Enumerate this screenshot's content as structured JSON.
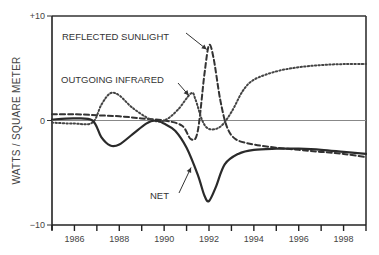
{
  "chart_data": {
    "type": "line",
    "title": "",
    "xlabel": "",
    "ylabel": "WATTS / SQUARE METER",
    "xlim": [
      1985,
      1999
    ],
    "ylim": [
      -10,
      10
    ],
    "x_ticks": [
      1986,
      1988,
      1990,
      1992,
      1994,
      1996,
      1998
    ],
    "x_minor_ticks": [
      1985,
      1987,
      1989,
      1991,
      1993,
      1995,
      1997,
      1999
    ],
    "y_ticks": [
      {
        "value": 10,
        "label": "+10"
      },
      {
        "value": 0,
        "label": "0"
      },
      {
        "value": -10,
        "label": "−10"
      }
    ],
    "zero_line": true,
    "series": [
      {
        "name": "REFLECTED SUNLIGHT",
        "style": "dashed",
        "x": [
          1985,
          1986,
          1987,
          1988,
          1989,
          1990,
          1990.8,
          1991.2,
          1991.5,
          1991.8,
          1992.0,
          1992.2,
          1992.5,
          1992.8,
          1993.2,
          1994,
          1995,
          1996,
          1997,
          1998,
          1999
        ],
        "y": [
          0.6,
          0.6,
          0.5,
          0.4,
          0.2,
          0.0,
          -0.5,
          -1.8,
          -1.0,
          4.5,
          7.2,
          6.0,
          2.0,
          -0.6,
          -1.8,
          -2.3,
          -2.6,
          -2.8,
          -3.0,
          -3.2,
          -3.5
        ]
      },
      {
        "name": "OUTGOING INFRARED",
        "style": "dotted",
        "x": [
          1985,
          1986,
          1986.8,
          1987.2,
          1987.6,
          1988,
          1988.6,
          1989.4,
          1990,
          1990.6,
          1991.2,
          1991.4,
          1991.7,
          1992,
          1992.5,
          1993,
          1993.5,
          1994,
          1995,
          1996,
          1997,
          1998,
          1999
        ],
        "y": [
          -0.2,
          -0.3,
          -0.2,
          1.5,
          2.6,
          2.4,
          1.2,
          0.1,
          0.0,
          1.0,
          2.6,
          2.0,
          0.0,
          -0.8,
          -0.6,
          0.8,
          2.8,
          3.9,
          4.7,
          5.1,
          5.3,
          5.4,
          5.4
        ]
      },
      {
        "name": "NET",
        "style": "solid",
        "x": [
          1985,
          1986,
          1986.8,
          1987.2,
          1987.6,
          1988,
          1988.6,
          1989.2,
          1989.6,
          1990,
          1990.5,
          1991,
          1991.5,
          1991.8,
          1992.0,
          1992.3,
          1992.7,
          1993.3,
          1994,
          1995,
          1996,
          1997,
          1998,
          1999
        ],
        "y": [
          0.1,
          0.2,
          0.0,
          -1.6,
          -2.4,
          -2.3,
          -1.3,
          -0.3,
          0.0,
          -0.3,
          -1.0,
          -2.6,
          -5.2,
          -7.2,
          -7.7,
          -6.4,
          -4.2,
          -3.2,
          -2.8,
          -2.7,
          -2.7,
          -2.8,
          -3.0,
          -3.2
        ]
      }
    ],
    "annotations": [
      {
        "text": "REFLECTED SUNLIGHT",
        "arrow_to": [
          1991.9,
          6.8
        ]
      },
      {
        "text": "OUTGOING INFRARED",
        "arrow_to": [
          1991.1,
          2.4
        ]
      },
      {
        "text": "NET",
        "arrow_to": [
          1991.2,
          -4.5
        ]
      }
    ]
  }
}
